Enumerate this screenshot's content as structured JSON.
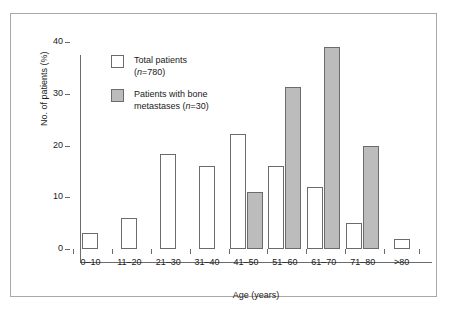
{
  "chart_data": {
    "type": "bar",
    "title": "",
    "xlabel": "Age (years)",
    "ylabel": "No. of patients (%)",
    "categories": [
      "0–10",
      "11–20",
      "21–30",
      "31–40",
      "41–50",
      "51–60",
      "61–70",
      "71–80",
      ">80"
    ],
    "series": [
      {
        "name": "Total patients (n=780)",
        "legend_label": "Total patients",
        "legend_sub": "(n=780)",
        "color": "#ffffff",
        "values": [
          3,
          6,
          18.3,
          16,
          22.3,
          16,
          12,
          5,
          2
        ]
      },
      {
        "name": "Patients with bone metastases (n=30)",
        "legend_label": "Patients with bone",
        "legend_sub": "metastases (n=30)",
        "color": "#bcbcbc",
        "values": [
          0,
          0,
          0,
          0,
          11,
          31.3,
          39,
          20,
          0
        ]
      }
    ],
    "ylim": [
      0,
      40
    ],
    "yticks": [
      0,
      10,
      20,
      30,
      40
    ],
    "ytick_labels": [
      "0",
      "10",
      "20",
      "30",
      "40"
    ],
    "grid": false,
    "legend_position": "top-left"
  },
  "legend": {
    "total": {
      "line1": "Total patients",
      "line2_prefix": "(",
      "line2_italic": "n",
      "line2_suffix": "=780)"
    },
    "mets": {
      "line1": "Patients with bone",
      "line2_prefix": "metastases (",
      "line2_italic": "n",
      "line2_suffix": "=30)"
    }
  }
}
